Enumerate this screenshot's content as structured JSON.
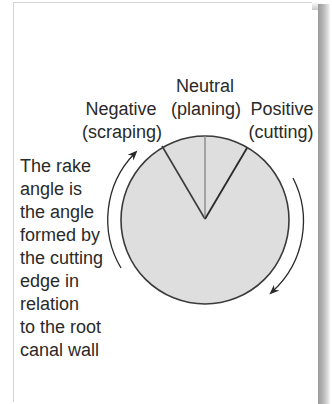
{
  "diagram": {
    "labels": {
      "neutral": {
        "line1": "Neutral",
        "line2": "(planing)"
      },
      "negative": {
        "line1": "Negative",
        "line2": "(scraping)"
      },
      "positive": {
        "line1": "Positive",
        "line2": "(cutting)"
      }
    },
    "description_lines": [
      "The rake",
      "angle is",
      "the angle",
      "formed by",
      "the cutting",
      "edge in",
      "relation",
      "to the root",
      "canal wall"
    ],
    "colors": {
      "circle_fill": "#dedede",
      "circle_stroke": "#3a3a3a",
      "neutral_line": "#8a8a8a",
      "rake_lines": "#3a3a3a",
      "arrows": "#2a2a2a",
      "text": "#2a2a2a"
    }
  }
}
